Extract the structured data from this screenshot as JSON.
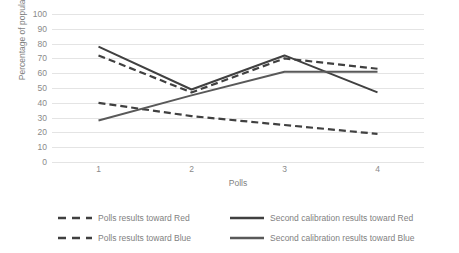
{
  "chart_data": {
    "type": "line",
    "title": "",
    "xlabel": "Polls",
    "ylabel": "Percentage of population",
    "categories": [
      "1",
      "2",
      "3",
      "4"
    ],
    "ylim": [
      0,
      100
    ],
    "yticks": [
      0,
      10,
      20,
      30,
      40,
      50,
      60,
      70,
      80,
      90,
      100
    ],
    "grid": true,
    "legend_position": "bottom",
    "series": [
      {
        "name": "Polls results toward Red",
        "style": "dashed",
        "color": "#404040",
        "values": [
          72,
          47,
          70,
          63
        ]
      },
      {
        "name": "Polls results toward Blue",
        "style": "dashed",
        "color": "#404040",
        "values": [
          40,
          31,
          25,
          19
        ]
      },
      {
        "name": "Second calibration results toward Red",
        "style": "solid",
        "color": "#404040",
        "values": [
          78,
          49,
          72,
          47
        ]
      },
      {
        "name": "Second calibration results toward Blue",
        "style": "solid",
        "color": "#595959",
        "values": [
          28,
          45,
          61,
          61
        ]
      }
    ]
  }
}
